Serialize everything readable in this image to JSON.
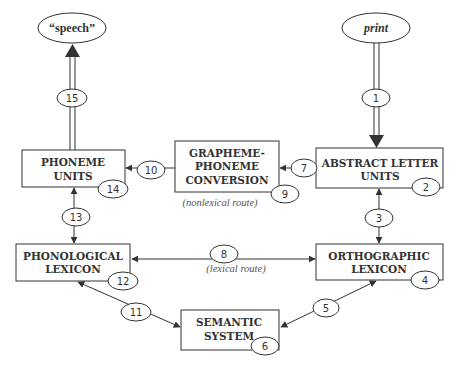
{
  "diagram": {
    "type": "dual-route reading model",
    "terminals": {
      "output": {
        "label": "“speech”"
      },
      "input": {
        "label": "print"
      }
    },
    "nodes": {
      "phoneme_units": {
        "line1": "PHONEME",
        "line2": "UNITS",
        "number": "14"
      },
      "gpc": {
        "line1": "GRAPHEME-",
        "line2": "PHONEME",
        "line3": "CONVERSION",
        "number": "9"
      },
      "abstract_letter_units": {
        "line1": "ABSTRACT LETTER",
        "line2": "UNITS",
        "number": "2"
      },
      "phonological_lexicon": {
        "line1": "PHONOLOGICAL",
        "line2": "LEXICON",
        "number": "12"
      },
      "orthographic_lexicon": {
        "line1": "ORTHOGRAPHIC",
        "line2": "LEXICON",
        "number": "4"
      },
      "semantic_system": {
        "line1": "SEMANTIC",
        "line2": "SYSTEM",
        "number": "6"
      }
    },
    "edges": {
      "print_to_abstract": {
        "number": "1"
      },
      "abstract_orthographic": {
        "number": "3"
      },
      "orthographic_semantic": {
        "number": "5"
      },
      "abstract_to_gpc": {
        "number": "7"
      },
      "orthographic_to_phonological": {
        "number": "8"
      },
      "gpc_to_phoneme": {
        "number": "10"
      },
      "semantic_phonological": {
        "number": "11"
      },
      "phoneme_phonological": {
        "number": "13"
      },
      "phoneme_to_speech": {
        "number": "15"
      }
    },
    "annotations": {
      "nonlexical_route": "(nonlexical route)",
      "lexical_route": "(lexical route)"
    }
  }
}
